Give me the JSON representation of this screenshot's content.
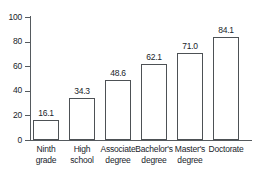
{
  "chart_data": {
    "type": "bar",
    "title": "",
    "subtitle": "",
    "xlabel": "",
    "ylabel": "",
    "ylim": [
      0,
      100
    ],
    "yticks": [
      0,
      20,
      40,
      60,
      80,
      100
    ],
    "grid": false,
    "legend": false,
    "legend_position": "none",
    "categories": [
      "Ninth grade",
      "High school",
      "Associate degree",
      "Bachelor's degree",
      "Master's degree",
      "Doctorate"
    ],
    "category_lines": [
      [
        "Ninth",
        "grade"
      ],
      [
        "High",
        "school"
      ],
      [
        "Associate",
        "degree"
      ],
      [
        "Bachelor's",
        "degree"
      ],
      [
        "Master's",
        "degree"
      ],
      [
        "Doctorate",
        ""
      ]
    ],
    "values": [
      16.1,
      34.3,
      48.6,
      62.1,
      71.0,
      84.1
    ],
    "value_labels": [
      "16.1",
      "34.3",
      "48.6",
      "62.1",
      "71.0",
      "84.1"
    ],
    "ytick_labels": [
      "0",
      "20",
      "40",
      "60",
      "80",
      "100"
    ],
    "colors": {
      "bar_fill": "#ffffff",
      "bar_stroke": "#4d5155",
      "axis": "#555a5e",
      "text": "#20242a",
      "background": "#ffffff"
    }
  }
}
